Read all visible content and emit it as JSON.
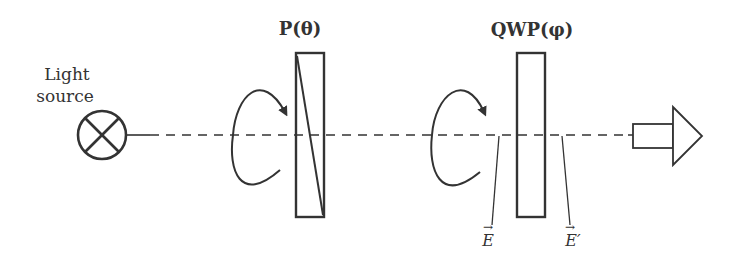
{
  "diagram": {
    "light_source": {
      "label_line1": "Light",
      "label_line2": "source",
      "icon": "crossed-circle-icon"
    },
    "polarizer": {
      "label": "P(θ)",
      "icon": "polarizer-icon"
    },
    "qwp": {
      "label": "QWP(φ)",
      "icon": "waveplate-icon"
    },
    "field_in": {
      "label": "E",
      "vector": "→"
    },
    "field_out": {
      "label": "E′",
      "vector": "→"
    },
    "output": {
      "icon": "arrow-output-icon"
    },
    "rotation_icon": "rotation-arrow-icon",
    "stroke_color": "#333333",
    "background": "#ffffff"
  }
}
